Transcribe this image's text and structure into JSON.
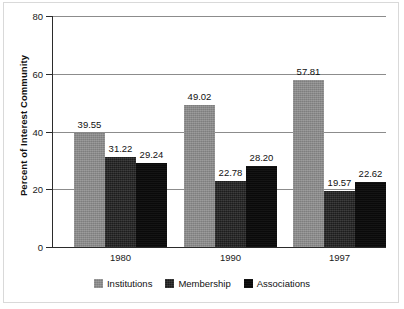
{
  "chart_data": {
    "type": "bar",
    "title": "",
    "xlabel": "",
    "ylabel": "Percent of Interest Community",
    "categories": [
      "1980",
      "1990",
      "1997"
    ],
    "series": [
      {
        "name": "Institutions",
        "values": [
          39.55,
          49.02,
          57.81
        ],
        "color": "#8a8a8a"
      },
      {
        "name": "Membership",
        "values": [
          31.22,
          22.78,
          19.57
        ],
        "color": "#232323"
      },
      {
        "name": "Associations",
        "values": [
          29.24,
          28.2,
          22.62
        ],
        "color": "#0b0b0b"
      }
    ],
    "value_labels": [
      [
        "39.55",
        "31.22",
        "29.24"
      ],
      [
        "49.02",
        "22.78",
        "28.20"
      ],
      [
        "57.81",
        "19.57",
        "22.62"
      ]
    ],
    "ylim": [
      0,
      80
    ],
    "yticks": [
      0,
      20,
      40,
      60,
      80
    ],
    "ytick_labels": [
      "0",
      "20",
      "40",
      "60",
      "80"
    ],
    "grid": "horizontal",
    "legend_position": "bottom",
    "data_labels": true
  },
  "axis": {
    "y_title": "Percent of Interest Community"
  },
  "legend": {
    "items": [
      {
        "label": "Institutions"
      },
      {
        "label": "Membership"
      },
      {
        "label": "Associations"
      }
    ]
  }
}
